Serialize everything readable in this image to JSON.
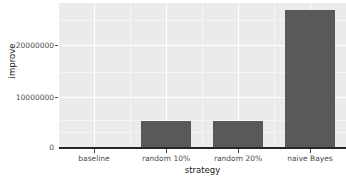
{
  "chart_data": {
    "type": "bar",
    "title": "",
    "subtitle": "",
    "xlabel": "strategy",
    "ylabel": "improve",
    "categories": [
      "baseline",
      "random 10%",
      "random 20%",
      "naive Bayes"
    ],
    "values": [
      0,
      5100000,
      5000000,
      26900000
    ],
    "series": [
      {
        "name": "improve",
        "values": [
          0,
          5100000,
          5000000,
          26900000
        ]
      }
    ],
    "ylim": [
      0,
      28200000
    ],
    "y_ticks": [
      0,
      10000000,
      20000000
    ],
    "y_tick_labels": [
      "0",
      "10000000",
      "20000000"
    ],
    "x_tick_labels": [
      "baseline",
      "random 10%",
      "random 20%",
      "naive Bayes"
    ],
    "grid": true,
    "grid_orientation": "both",
    "legend": false,
    "legend_position": "none",
    "bar_color": "#595959",
    "panel_color": "#ebebeb",
    "grid_color": "#ffffff",
    "axis_color": "#262626",
    "tick_label_color": "#4d4d4d",
    "axis_title_color": "#1a1a1a"
  }
}
